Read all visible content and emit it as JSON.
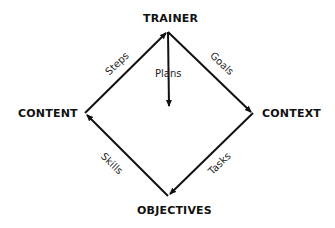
{
  "nodes": {
    "top": "TRAINER",
    "left": "CONTENT",
    "right": "CONTEXT",
    "bottom": "OBJECTIVES"
  },
  "edges": {
    "left_to_top": "Steps",
    "top_to_right": "Goals",
    "top_down": "Plans",
    "right_to_bottom": "Tasks",
    "bottom_to_left": "Skills"
  },
  "colors": {
    "line": "#111111",
    "background": "#ffffff"
  }
}
